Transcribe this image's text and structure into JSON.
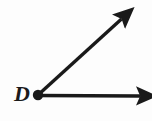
{
  "figure": {
    "type": "geometry-angle-diagram",
    "background_color": "#fdfdfd",
    "stroke_color": "#1a1a1a",
    "vertex": {
      "label": "D",
      "x": 38,
      "y": 95,
      "dot_radius": 5,
      "label_x": 14,
      "label_y": 101
    },
    "rays": [
      {
        "name": "horizontal-ray",
        "from_x": 38,
        "from_y": 95,
        "to_x": 147,
        "to_y": 96,
        "stroke_width": 3.4,
        "arrowhead": "filled-triangle"
      },
      {
        "name": "diagonal-ray",
        "from_x": 38,
        "from_y": 95,
        "to_x": 128,
        "to_y": 13,
        "stroke_width": 3.4,
        "arrowhead": "filled-triangle"
      }
    ],
    "angle_degrees": 42
  }
}
